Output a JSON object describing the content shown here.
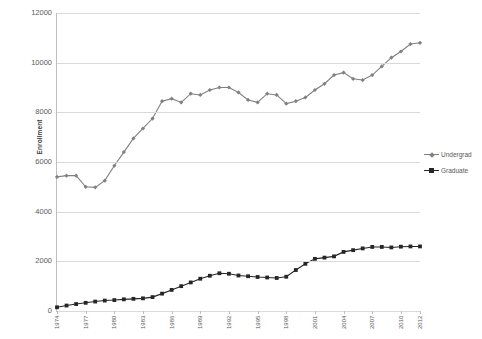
{
  "chart_data": {
    "type": "line",
    "title": "",
    "xlabel": "",
    "ylabel": "Enrollment",
    "ylim": [
      0,
      12000
    ],
    "ytick_values": [
      0,
      2000,
      4000,
      6000,
      8000,
      10000,
      12000
    ],
    "ytick_labels": [
      "0",
      "2000",
      "4000",
      "6000",
      "8000",
      "10000",
      "12000"
    ],
    "grid": true,
    "legend_position": "right",
    "x": [
      1974,
      1975,
      1976,
      1977,
      1978,
      1979,
      1980,
      1981,
      1982,
      1983,
      1984,
      1985,
      1986,
      1987,
      1988,
      1989,
      1990,
      1991,
      1992,
      1993,
      1994,
      1995,
      1996,
      1997,
      1998,
      1999,
      2000,
      2001,
      2002,
      2003,
      2004,
      2005,
      2006,
      2007,
      2008,
      2009,
      2010,
      2011,
      2012
    ],
    "xtick_labels": [
      "1974",
      "1977",
      "1980",
      "1983",
      "1986",
      "1989",
      "1992",
      "1995",
      "1998",
      "2001",
      "2004",
      "2007",
      "2010",
      "2012"
    ],
    "xtick_positions": [
      1974,
      1977,
      1980,
      1983,
      1986,
      1989,
      1992,
      1995,
      1998,
      2001,
      2004,
      2007,
      2010,
      2012
    ],
    "series": [
      {
        "name": "Undergrad",
        "color": "#808080",
        "marker": "diamond",
        "values": [
          5400,
          5450,
          5450,
          5000,
          4980,
          5250,
          5850,
          6400,
          6950,
          7350,
          7750,
          8450,
          8550,
          8400,
          8750,
          8700,
          8900,
          9000,
          9000,
          8800,
          8500,
          8400,
          8750,
          8700,
          8350,
          8450,
          8600,
          8900,
          9150,
          9500,
          9600,
          9350,
          9300,
          9500,
          9850,
          10200,
          10450,
          10750,
          10800
        ]
      },
      {
        "name": "Graduate",
        "color": "#262626",
        "marker": "square",
        "values": [
          150,
          220,
          280,
          330,
          380,
          420,
          440,
          470,
          490,
          510,
          560,
          700,
          850,
          1000,
          1150,
          1300,
          1420,
          1520,
          1500,
          1430,
          1400,
          1370,
          1350,
          1330,
          1380,
          1650,
          1900,
          2100,
          2150,
          2200,
          2380,
          2450,
          2520,
          2580,
          2580,
          2560,
          2590,
          2600,
          2600
        ]
      }
    ]
  },
  "legend": {
    "items": [
      {
        "label": "Undergrad",
        "color": "#808080"
      },
      {
        "label": "Graduate",
        "color": "#262626"
      }
    ]
  }
}
